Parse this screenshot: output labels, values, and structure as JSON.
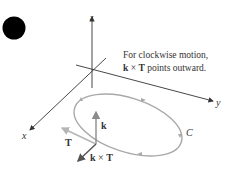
{
  "diagram": {
    "caption_line1": "For clockwise motion,",
    "caption_line2_bold_k": "k",
    "caption_line2_times": " × ",
    "caption_line2_bold_T": "T",
    "caption_line2_rest": " points outward.",
    "axis_x": "x",
    "axis_y": "y",
    "axis_z": "z",
    "curve_label": "C",
    "vector_k": "k",
    "vector_T": "T",
    "vector_kxT_k": "k",
    "vector_kxT_times": " × ",
    "vector_kxT_T": "T",
    "colors": {
      "axes": "#333333",
      "curve": "#a9a9a9",
      "vector_k": "#8c8c8c",
      "vector_T": "#b5b5b5",
      "vector_kxT": "#555555",
      "dot": "#000000"
    }
  }
}
